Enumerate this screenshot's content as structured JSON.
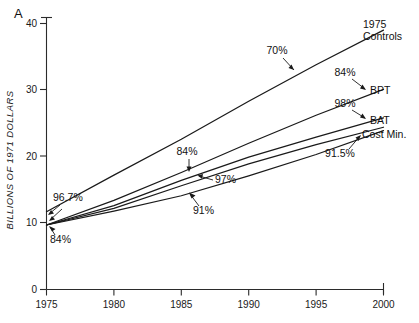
{
  "figure": {
    "panel_label": "A",
    "caption_fragment": ""
  },
  "chart_data": {
    "type": "line",
    "title": "",
    "subtitle": "",
    "xlabel": "",
    "ylabel": "BILLIONS OF 1971 DOLLARS",
    "x": [
      1975,
      1980,
      1985,
      1990,
      1995,
      2000
    ],
    "xlim": [
      1975,
      2000
    ],
    "ylim": [
      0,
      40
    ],
    "xticks": [
      1975,
      1980,
      1985,
      1990,
      1995,
      2000
    ],
    "xtick_labels": [
      "1975",
      "1980",
      "1985",
      "1990",
      "1995",
      "2000"
    ],
    "yticks": [
      0,
      10,
      20,
      30,
      40
    ],
    "ytick_labels": [
      "0",
      "10",
      "20",
      "30",
      "40"
    ],
    "grid": false,
    "legend_position": "right-end-labels",
    "series": [
      {
        "name": "1975 Controls",
        "label": "1975\nControls",
        "label_line1": "1975",
        "label_line2": "Controls",
        "annotation": "70%",
        "values": [
          11.7,
          17.2,
          22.6,
          28.3,
          33.8,
          39.0
        ]
      },
      {
        "name": "BPT",
        "label": "BPT",
        "annotation": "84%",
        "values": [
          9.7,
          13.4,
          17.6,
          22.0,
          26.2,
          30.1
        ]
      },
      {
        "name": "BAT",
        "label": "BAT",
        "annotation": "98%",
        "values": [
          9.7,
          12.6,
          16.4,
          19.9,
          22.9,
          25.8
        ]
      },
      {
        "name": "Cost Min.",
        "label": "Cost Min.",
        "annotation": "91.5%",
        "values": [
          9.7,
          12.2,
          15.6,
          18.9,
          21.8,
          24.4
        ]
      },
      {
        "name": "Lower curve",
        "label": "",
        "annotation": "91%",
        "values": [
          9.7,
          11.8,
          14.1,
          17.1,
          20.3,
          23.9
        ]
      }
    ],
    "annotations": [
      {
        "text": "70%",
        "target_series": "1975 Controls",
        "near_x": 1991
      },
      {
        "text": "84%",
        "target_series": "BPT",
        "near_x": 1999,
        "position": "right"
      },
      {
        "text": "98%",
        "target_series": "BAT",
        "near_x": 1999,
        "position": "right"
      },
      {
        "text": "91.5%",
        "target_series": "Cost Min.",
        "near_x": 1998,
        "position": "right-below"
      },
      {
        "text": "96.7%",
        "target_series": "1975 Controls",
        "near_x": 1976,
        "position": "left"
      },
      {
        "text": "84%",
        "target_series": "BPT",
        "near_x": 1975,
        "position": "left-below"
      },
      {
        "text": "84%",
        "target_series": "BPT",
        "near_x": 1985,
        "position": "mid-above"
      },
      {
        "text": "97%",
        "target_series": "BAT",
        "near_x": 1986,
        "position": "mid-right"
      },
      {
        "text": "91%",
        "target_series": "Lower curve",
        "near_x": 1987,
        "position": "mid-below"
      }
    ]
  }
}
